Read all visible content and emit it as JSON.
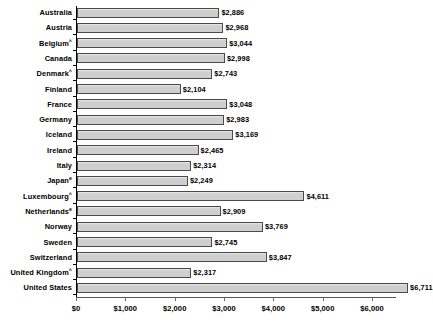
{
  "chart_data": {
    "type": "bar",
    "orientation": "horizontal",
    "title": "",
    "subtitle": "",
    "xlabel": "",
    "ylabel": "",
    "xlim": [
      0,
      6000
    ],
    "ylim": null,
    "grid": false,
    "legend": null,
    "xticks": [
      0,
      1000,
      2000,
      3000,
      4000,
      5000,
      6000
    ],
    "xtick_labels": [
      "$0",
      "$1,000",
      "$2,000",
      "$3,000",
      "$4,000",
      "$5,000",
      "$6,000"
    ],
    "categories": [
      "Australia",
      "Austria",
      "Belgium^",
      "Canada",
      "Denmark^",
      "Finland",
      "France",
      "Germany",
      "Iceland",
      "Ireland",
      "Italy",
      "Japanᵉ",
      "Luxembourg^",
      "Netherlandsᵉ",
      "Norway",
      "Sweden",
      "Switzerland",
      "United Kingdom^",
      "United States"
    ],
    "values": [
      2886,
      2968,
      3044,
      2998,
      2743,
      2104,
      3048,
      2983,
      3169,
      2465,
      2314,
      2249,
      4611,
      2909,
      3769,
      2745,
      3847,
      2317,
      6711
    ],
    "data_labels": [
      "$2,886",
      "$2,968",
      "$3,044",
      "$2,998",
      "$2,743",
      "$2,104",
      "$3,048",
      "$2,983",
      "$3,169",
      "$2,465",
      "$2,314",
      "$2,249",
      "$4,611",
      "$2,909",
      "$3,769",
      "$2,745",
      "$3,847",
      "$2,317",
      "$6,711"
    ],
    "bar_color": "#d2d2d2",
    "bar_border_color": "#4a4a4a",
    "axis_color": "#000000"
  },
  "rows": [
    {
      "label": "Australia",
      "marker": "",
      "value": 2886,
      "label_text": "$2,886"
    },
    {
      "label": "Austria",
      "marker": "",
      "value": 2968,
      "label_text": "$2,968"
    },
    {
      "label": "Belgium",
      "marker": "^",
      "value": 3044,
      "label_text": "$3,044"
    },
    {
      "label": "Canada",
      "marker": "",
      "value": 2998,
      "label_text": "$2,998"
    },
    {
      "label": "Denmark",
      "marker": "^",
      "value": 2743,
      "label_text": "$2,743"
    },
    {
      "label": "Finland",
      "marker": "",
      "value": 2104,
      "label_text": "$2,104"
    },
    {
      "label": "France",
      "marker": "",
      "value": 3048,
      "label_text": "$3,048"
    },
    {
      "label": "Germany",
      "marker": "",
      "value": 2983,
      "label_text": "$2,983"
    },
    {
      "label": "Iceland",
      "marker": "",
      "value": 3169,
      "label_text": "$3,169"
    },
    {
      "label": "Ireland",
      "marker": "",
      "value": 2465,
      "label_text": "$2,465"
    },
    {
      "label": "Italy",
      "marker": "",
      "value": 2314,
      "label_text": "$2,314"
    },
    {
      "label": "Japan",
      "marker": "e",
      "value": 2249,
      "label_text": "$2,249"
    },
    {
      "label": "Luxembourg",
      "marker": "^",
      "value": 4611,
      "label_text": "$4,611"
    },
    {
      "label": "Netherlands",
      "marker": "e",
      "value": 2909,
      "label_text": "$2,909"
    },
    {
      "label": "Norway",
      "marker": "",
      "value": 3769,
      "label_text": "$3,769"
    },
    {
      "label": "Sweden",
      "marker": "",
      "value": 2745,
      "label_text": "$2,745"
    },
    {
      "label": "Switzerland",
      "marker": "",
      "value": 3847,
      "label_text": "$3,847"
    },
    {
      "label": "United Kingdom",
      "marker": "^",
      "value": 2317,
      "label_text": "$2,317"
    },
    {
      "label": "United States",
      "marker": "",
      "value": 6711,
      "label_text": "$6,711"
    }
  ],
  "axis": {
    "ticks": [
      {
        "value": 0,
        "label": "$0"
      },
      {
        "value": 1000,
        "label": "$1,000"
      },
      {
        "value": 2000,
        "label": "$2,000"
      },
      {
        "value": 3000,
        "label": "$3,000"
      },
      {
        "value": 4000,
        "label": "$4,000"
      },
      {
        "value": 5000,
        "label": "$5,000"
      },
      {
        "value": 6000,
        "label": "$6,000"
      }
    ]
  }
}
